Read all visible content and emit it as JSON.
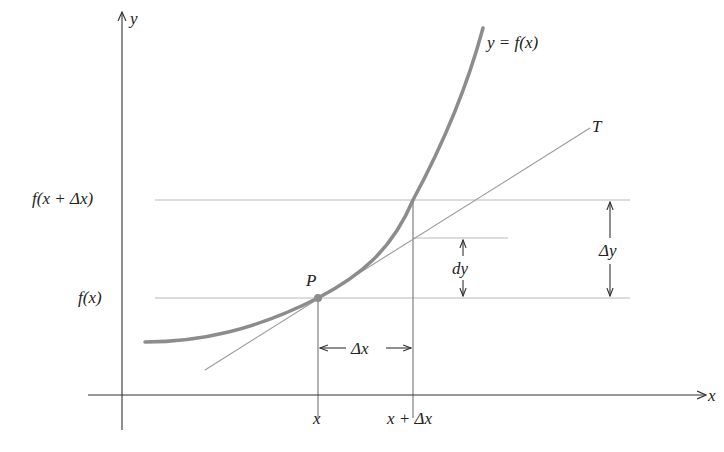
{
  "diagram": {
    "colors": {
      "curve": "#8c8c8c",
      "tangent": "#9a9a9a",
      "guide": "#b5b5b5",
      "axis": "#333333",
      "text": "#222222",
      "point": "#8c8c8c"
    },
    "axes": {
      "x_label": "x",
      "y_label": "y"
    },
    "curve_label": "y = f(x)",
    "tangent_label": "T",
    "point_label": "P",
    "y_ticks": [
      {
        "label": "f(x + Δx)",
        "y": 200
      },
      {
        "label": "f(x)",
        "y": 298
      }
    ],
    "x_ticks": [
      {
        "label": "x",
        "x": 318
      },
      {
        "label": "x + Δx",
        "x": 413
      }
    ],
    "annotations": {
      "dx": "Δx",
      "dy": "dy",
      "delta_y": "Δy"
    }
  }
}
